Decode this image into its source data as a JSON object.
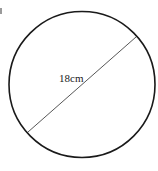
{
  "diagram": {
    "shape": "circle",
    "stroke_color": "#1a1a1a",
    "diameter_line_color": "#444444",
    "circle": {
      "cx": 82,
      "cy": 84.5,
      "r": 73
    },
    "diameter_line": {
      "x1": 28,
      "y1": 132,
      "x2": 136,
      "y2": 37
    },
    "measurement_label": "18cm"
  }
}
